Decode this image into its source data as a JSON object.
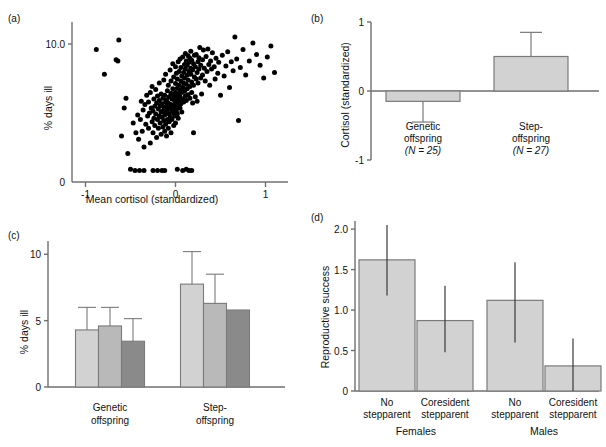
{
  "figure": {
    "panels": [
      "a",
      "b",
      "c",
      "d"
    ],
    "colors": {
      "ink": "#111111",
      "axis": "#6f6f6f",
      "bar_light": "#d2d2d2",
      "bar_mid": "#b9b9b9",
      "bar_dark": "#8a8a8a",
      "bar_stroke": "#7a7a7a",
      "point": "#000000"
    }
  },
  "panel_a": {
    "label": "(a)",
    "chart_data": {
      "type": "scatter",
      "title": "",
      "xlabel": "Mean cortisol (standardized)",
      "ylabel": "% days ill",
      "yscale": "log",
      "xlim": [
        -1.15,
        1.25
      ],
      "ylim": [
        0.55,
        14
      ],
      "xticks": [
        -1,
        0,
        1
      ],
      "xticklabels": [
        "-1",
        "0",
        "1"
      ],
      "yticks": [
        10
      ],
      "yticklabels": [
        "10.0"
      ],
      "y_origin_label": "0",
      "grid": false,
      "n_points": 232,
      "points": [
        [
          -0.88,
          8.9
        ],
        [
          -0.63,
          10.9
        ],
        [
          -0.66,
          7.2
        ],
        [
          -0.64,
          7.0
        ],
        [
          -0.79,
          5.3
        ],
        [
          -0.55,
          3.2
        ],
        [
          -0.57,
          2.6
        ],
        [
          -0.6,
          1.45
        ],
        [
          -0.53,
          1.0
        ],
        [
          -0.47,
          1.9
        ],
        [
          -0.5,
          0.72
        ],
        [
          -0.45,
          0.7
        ],
        [
          -0.44,
          1.55
        ],
        [
          -0.42,
          2.25
        ],
        [
          -0.41,
          1.35
        ],
        [
          -0.4,
          0.7
        ],
        [
          -0.39,
          2.05
        ],
        [
          -0.38,
          3.0
        ],
        [
          -0.37,
          1.6
        ],
        [
          -0.36,
          2.5
        ],
        [
          -0.35,
          1.15
        ],
        [
          -0.34,
          2.8
        ],
        [
          -0.33,
          1.85
        ],
        [
          -0.32,
          3.4
        ],
        [
          -0.31,
          2.2
        ],
        [
          -0.3,
          1.7
        ],
        [
          -0.3,
          2.95
        ],
        [
          -0.29,
          2.35
        ],
        [
          -0.28,
          1.25
        ],
        [
          -0.28,
          3.6
        ],
        [
          -0.27,
          2.6
        ],
        [
          -0.26,
          1.95
        ],
        [
          -0.26,
          4.1
        ],
        [
          -0.25,
          2.45
        ],
        [
          -0.25,
          1.55
        ],
        [
          -0.24,
          3.15
        ],
        [
          -0.24,
          2.1
        ],
        [
          -0.23,
          2.7
        ],
        [
          -0.23,
          1.8
        ],
        [
          -0.22,
          3.85
        ],
        [
          -0.22,
          2.3
        ],
        [
          -0.21,
          1.4
        ],
        [
          -0.21,
          2.9
        ],
        [
          -0.2,
          2.05
        ],
        [
          -0.2,
          3.35
        ],
        [
          -0.2,
          0.7
        ],
        [
          -0.19,
          2.55
        ],
        [
          -0.19,
          1.7
        ],
        [
          -0.18,
          4.4
        ],
        [
          -0.18,
          2.2
        ],
        [
          -0.18,
          3.05
        ],
        [
          -0.17,
          1.9
        ],
        [
          -0.17,
          2.75
        ],
        [
          -0.16,
          2.4
        ],
        [
          -0.16,
          1.5
        ],
        [
          -0.16,
          3.5
        ],
        [
          -0.15,
          2.15
        ],
        [
          -0.15,
          2.85
        ],
        [
          -0.15,
          0.7
        ],
        [
          -0.14,
          1.75
        ],
        [
          -0.14,
          3.2
        ],
        [
          -0.14,
          2.45
        ],
        [
          -0.13,
          2.0
        ],
        [
          -0.13,
          4.7
        ],
        [
          -0.13,
          2.65
        ],
        [
          -0.12,
          1.6
        ],
        [
          -0.12,
          3.4
        ],
        [
          -0.12,
          2.25
        ],
        [
          -0.11,
          2.95
        ],
        [
          -0.11,
          1.85
        ],
        [
          -0.11,
          5.3
        ],
        [
          -0.1,
          2.4
        ],
        [
          -0.1,
          3.1
        ],
        [
          -0.1,
          1.45
        ],
        [
          -0.1,
          2.7
        ],
        [
          -0.09,
          2.05
        ],
        [
          -0.09,
          3.75
        ],
        [
          -0.09,
          2.5
        ],
        [
          -0.08,
          1.7
        ],
        [
          -0.08,
          2.9
        ],
        [
          -0.08,
          4.2
        ],
        [
          -0.07,
          2.3
        ],
        [
          -0.07,
          3.3
        ],
        [
          -0.07,
          1.95
        ],
        [
          -0.06,
          2.6
        ],
        [
          -0.06,
          5.8
        ],
        [
          -0.06,
          2.15
        ],
        [
          -0.05,
          3.55
        ],
        [
          -0.05,
          2.8
        ],
        [
          -0.05,
          1.55
        ],
        [
          -0.05,
          4.6
        ],
        [
          -0.04,
          2.45
        ],
        [
          -0.04,
          3.15
        ],
        [
          -0.04,
          2.05
        ],
        [
          -0.03,
          6.6
        ],
        [
          -0.03,
          2.7
        ],
        [
          -0.03,
          3.9
        ],
        [
          -0.02,
          2.35
        ],
        [
          -0.02,
          3.4
        ],
        [
          -0.02,
          1.8
        ],
        [
          -0.02,
          5.0
        ],
        [
          -0.01,
          2.55
        ],
        [
          -0.01,
          3.05
        ],
        [
          -0.01,
          2.2
        ],
        [
          0.0,
          4.35
        ],
        [
          0.0,
          2.85
        ],
        [
          0.0,
          3.6
        ],
        [
          0.0,
          1.9
        ],
        [
          0.0,
          6.2
        ],
        [
          0.01,
          2.45
        ],
        [
          0.01,
          3.25
        ],
        [
          0.01,
          2.65
        ],
        [
          0.01,
          5.4
        ],
        [
          0.02,
          3.95
        ],
        [
          0.02,
          2.3
        ],
        [
          0.02,
          4.8
        ],
        [
          0.02,
          3.1
        ],
        [
          0.03,
          2.75
        ],
        [
          0.03,
          6.9
        ],
        [
          0.03,
          3.5
        ],
        [
          0.03,
          2.1
        ],
        [
          0.04,
          4.2
        ],
        [
          0.04,
          3.0
        ],
        [
          0.04,
          5.6
        ],
        [
          0.05,
          2.6
        ],
        [
          0.05,
          3.8
        ],
        [
          0.05,
          7.3
        ],
        [
          0.05,
          3.3
        ],
        [
          0.06,
          4.6
        ],
        [
          0.06,
          2.85
        ],
        [
          0.06,
          6.1
        ],
        [
          0.07,
          3.6
        ],
        [
          0.07,
          5.1
        ],
        [
          0.07,
          2.4
        ],
        [
          0.08,
          4.0
        ],
        [
          0.08,
          7.6
        ],
        [
          0.08,
          3.15
        ],
        [
          0.09,
          5.5
        ],
        [
          0.09,
          4.4
        ],
        [
          0.09,
          2.95
        ],
        [
          0.1,
          6.5
        ],
        [
          0.1,
          3.7
        ],
        [
          0.1,
          4.9
        ],
        [
          0.11,
          8.2
        ],
        [
          0.11,
          3.35
        ],
        [
          0.11,
          5.9
        ],
        [
          0.12,
          4.3
        ],
        [
          0.12,
          7.0
        ],
        [
          0.12,
          3.05
        ],
        [
          0.13,
          5.2
        ],
        [
          0.13,
          6.4
        ],
        [
          0.13,
          3.9
        ],
        [
          0.14,
          7.8
        ],
        [
          0.14,
          4.7
        ],
        [
          0.14,
          3.45
        ],
        [
          0.15,
          5.6
        ],
        [
          0.15,
          6.8
        ],
        [
          0.15,
          0.7
        ],
        [
          0.16,
          4.1
        ],
        [
          0.16,
          7.4
        ],
        [
          0.16,
          3.2
        ],
        [
          0.17,
          5.3
        ],
        [
          0.17,
          8.6
        ],
        [
          0.17,
          6.0
        ],
        [
          0.18,
          4.5
        ],
        [
          0.18,
          3.6
        ],
        [
          0.18,
          7.1
        ],
        [
          0.19,
          5.8
        ],
        [
          0.19,
          2.9
        ],
        [
          0.2,
          6.6
        ],
        [
          0.2,
          4.2
        ],
        [
          0.2,
          1.55
        ],
        [
          0.21,
          7.9
        ],
        [
          0.21,
          5.0
        ],
        [
          0.22,
          3.3
        ],
        [
          0.22,
          6.2
        ],
        [
          0.23,
          4.8
        ],
        [
          0.23,
          8.0
        ],
        [
          0.24,
          5.5
        ],
        [
          0.24,
          3.0
        ],
        [
          0.25,
          6.9
        ],
        [
          0.25,
          4.4
        ],
        [
          0.26,
          7.5
        ],
        [
          0.26,
          5.9
        ],
        [
          0.27,
          9.3
        ],
        [
          0.28,
          4.9
        ],
        [
          0.28,
          6.4
        ],
        [
          0.29,
          3.5
        ],
        [
          0.3,
          7.2
        ],
        [
          0.3,
          5.2
        ],
        [
          0.31,
          8.8
        ],
        [
          0.32,
          6.0
        ],
        [
          0.33,
          4.6
        ],
        [
          0.34,
          7.7
        ],
        [
          0.35,
          5.6
        ],
        [
          0.36,
          9.0
        ],
        [
          0.37,
          6.5
        ],
        [
          0.38,
          4.2
        ],
        [
          0.39,
          7.0
        ],
        [
          0.4,
          5.9
        ],
        [
          0.41,
          8.3
        ],
        [
          0.43,
          6.2
        ],
        [
          0.44,
          4.8
        ],
        [
          0.45,
          7.4
        ],
        [
          0.47,
          5.4
        ],
        [
          0.48,
          6.8
        ],
        [
          0.5,
          3.4
        ],
        [
          0.52,
          7.9
        ],
        [
          0.54,
          5.1
        ],
        [
          0.56,
          6.3
        ],
        [
          0.58,
          8.5
        ],
        [
          0.6,
          4.0
        ],
        [
          0.62,
          6.9
        ],
        [
          0.64,
          5.7
        ],
        [
          0.66,
          11.6
        ],
        [
          0.68,
          7.3
        ],
        [
          0.7,
          2.0
        ],
        [
          0.72,
          6.1
        ],
        [
          0.75,
          8.9
        ],
        [
          0.78,
          5.2
        ],
        [
          0.82,
          7.0
        ],
        [
          0.86,
          10.2
        ],
        [
          0.9,
          8.0
        ],
        [
          0.94,
          6.4
        ],
        [
          0.98,
          4.9
        ],
        [
          1.02,
          7.6
        ],
        [
          1.06,
          9.6
        ],
        [
          1.1,
          5.5
        ],
        [
          -0.35,
          0.7
        ],
        [
          -0.12,
          0.7
        ],
        [
          0.08,
          0.7
        ],
        [
          0.18,
          0.7
        ],
        [
          -0.25,
          0.7
        ],
        [
          0.02,
          0.72
        ],
        [
          0.12,
          0.72
        ]
      ]
    }
  },
  "panel_b": {
    "label": "(b)",
    "chart_data": {
      "type": "bar",
      "title": "",
      "xlabel": "",
      "ylabel": "Cortisol (standardized)",
      "ylim": [
        -1,
        1
      ],
      "yticks": [
        -1,
        0,
        1
      ],
      "yticklabels": [
        "-1",
        "0",
        "1"
      ],
      "grid": false,
      "categories": [
        "Genetic offspring",
        "Step-offspring"
      ],
      "category_lines": [
        [
          "Genetic",
          "offspring",
          "(N = 25)"
        ],
        [
          "Step-",
          "offspring",
          "(N = 27)"
        ]
      ],
      "sample_sizes": [
        "(N = 25)",
        "(N = 27)"
      ],
      "values": [
        -0.15,
        0.5
      ],
      "error_low": [
        -0.45,
        0.5
      ],
      "error_high": [
        -0.15,
        0.85
      ],
      "errorbar_style": "capped"
    }
  },
  "panel_c": {
    "label": "(c)",
    "chart_data": {
      "type": "bar",
      "title": "",
      "xlabel": "",
      "ylabel": "% days ill",
      "ylim": [
        0,
        11
      ],
      "yticks": [
        0,
        5,
        10
      ],
      "yticklabels": [
        "0",
        "5",
        "10"
      ],
      "grid": false,
      "categories": [
        "Genetic offspring",
        "Step-offspring"
      ],
      "category_lines": [
        [
          "Genetic",
          "offspring"
        ],
        [
          "Step-",
          "offspring"
        ]
      ],
      "series": [
        {
          "name": "bar-1",
          "shade": "light",
          "values": [
            4.3,
            7.75
          ],
          "error_high": [
            6.0,
            10.2
          ]
        },
        {
          "name": "bar-2",
          "shade": "mid",
          "values": [
            4.6,
            6.3
          ],
          "error_high": [
            6.0,
            8.5
          ]
        },
        {
          "name": "bar-3",
          "shade": "dark",
          "values": [
            3.45,
            5.8
          ],
          "error_high": [
            5.15,
            null
          ]
        }
      ],
      "errorbar_style": "capped-upper"
    }
  },
  "panel_d": {
    "label": "(d)",
    "chart_data": {
      "type": "bar",
      "title": "",
      "xlabel": "",
      "ylabel": "Reproductive success",
      "ylim": [
        0,
        2.1
      ],
      "yticks": [
        0,
        0.5,
        1.0,
        1.5,
        2.0
      ],
      "yticklabels": [
        "0",
        "0.5",
        "1.0",
        "1.5",
        "2.0"
      ],
      "grid": false,
      "groups": [
        "Females",
        "Males"
      ],
      "categories": [
        "No stepparent",
        "Coresident stepparent",
        "No stepparent",
        "Coresident stepparent"
      ],
      "category_lines": [
        [
          "No",
          "stepparent"
        ],
        [
          "Coresident",
          "stepparent"
        ],
        [
          "No",
          "stepparent"
        ],
        [
          "Coresident",
          "stepparent"
        ]
      ],
      "values": [
        1.62,
        0.87,
        1.12,
        0.31
      ],
      "error_low": [
        1.18,
        0.48,
        0.6,
        0.0
      ],
      "error_high": [
        2.05,
        1.3,
        1.59,
        0.65
      ],
      "errorbar_style": "plain-line"
    }
  }
}
